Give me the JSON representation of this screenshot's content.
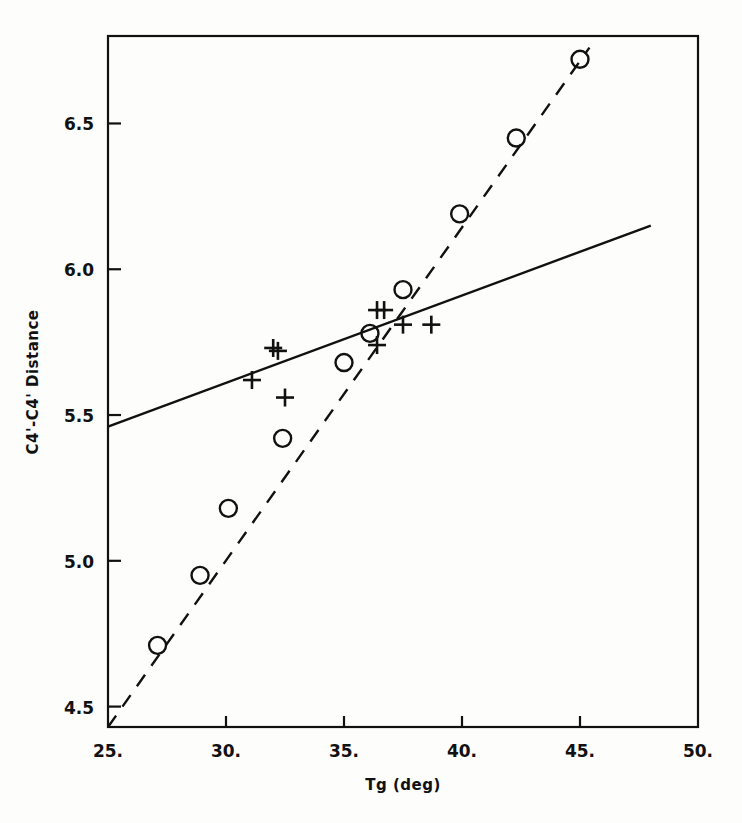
{
  "figure": {
    "background_color": "#fdfdfc",
    "ink_color": "#111111"
  },
  "chart_data": {
    "type": "scatter",
    "title": "",
    "xlabel": "Tg (deg)",
    "ylabel": "C4'-C4' Distance",
    "xlim": [
      25.0,
      50.0
    ],
    "ylim": [
      4.43,
      6.8
    ],
    "grid": false,
    "legend": "none",
    "xticks": [
      25.0,
      30.0,
      35.0,
      40.0,
      45.0,
      50.0
    ],
    "xtick_labels": [
      "25.",
      "30.",
      "35.",
      "40.",
      "45.",
      "50."
    ],
    "yticks": [
      4.5,
      5.0,
      5.5,
      6.0,
      6.5
    ],
    "ytick_labels": [
      "4.5",
      "5.0",
      "5.5",
      "6.0",
      "6.5"
    ],
    "series": [
      {
        "name": "circles",
        "marker": "circle",
        "linestyle": "dashed",
        "points": [
          {
            "x": 27.1,
            "y": 4.71
          },
          {
            "x": 28.9,
            "y": 4.95
          },
          {
            "x": 30.1,
            "y": 5.18
          },
          {
            "x": 32.4,
            "y": 5.42
          },
          {
            "x": 35.0,
            "y": 5.68
          },
          {
            "x": 36.1,
            "y": 5.78
          },
          {
            "x": 37.5,
            "y": 5.93
          },
          {
            "x": 39.9,
            "y": 6.19
          },
          {
            "x": 42.3,
            "y": 6.45
          },
          {
            "x": 45.0,
            "y": 6.72
          }
        ],
        "fit_line": {
          "x1": 25.0,
          "y1": 4.43,
          "x2": 45.4,
          "y2": 6.76
        }
      },
      {
        "name": "plus-signs",
        "marker": "plus",
        "linestyle": "solid",
        "points": [
          {
            "x": 31.1,
            "y": 5.62
          },
          {
            "x": 32.0,
            "y": 5.73
          },
          {
            "x": 32.2,
            "y": 5.72
          },
          {
            "x": 32.5,
            "y": 5.56
          },
          {
            "x": 36.4,
            "y": 5.86
          },
          {
            "x": 36.7,
            "y": 5.86
          },
          {
            "x": 36.4,
            "y": 5.74
          },
          {
            "x": 37.5,
            "y": 5.81
          },
          {
            "x": 38.7,
            "y": 5.81
          }
        ],
        "fit_line": {
          "x1": 25.0,
          "y1": 5.46,
          "x2": 48.0,
          "y2": 6.15
        }
      }
    ]
  }
}
